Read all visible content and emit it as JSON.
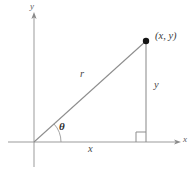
{
  "figure": {
    "background_color": "#ffffff",
    "line_color": "#8a8a8a",
    "axis_color": "#9a9a9a",
    "text_color": "#4a4a4a",
    "point_color": "#1a1a1a",
    "labels": {
      "axis_y": "y",
      "axis_x": "x",
      "point": "(x,  y)",
      "hypotenuse": "r",
      "opposite": "y",
      "adjacent": "x",
      "angle": "θ"
    },
    "geometry": {
      "origin": {
        "x": 34,
        "y": 142
      },
      "point": {
        "x": 146,
        "y": 41
      },
      "foot": {
        "x": 146,
        "y": 142
      },
      "y_axis_top": {
        "x": 34,
        "y": 14
      },
      "y_axis_bottom": {
        "x": 34,
        "y": 167
      },
      "x_axis_left": {
        "x": 8,
        "y": 142
      },
      "x_axis_right": {
        "x": 178,
        "y": 142
      },
      "angle_arc_radius": 27,
      "right_angle_size": 10,
      "point_radius": 3.2
    }
  }
}
